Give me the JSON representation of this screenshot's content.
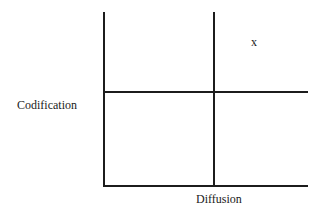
{
  "diagram": {
    "y_axis_label": "Codification",
    "x_axis_label": "Diffusion",
    "marker": "x"
  }
}
